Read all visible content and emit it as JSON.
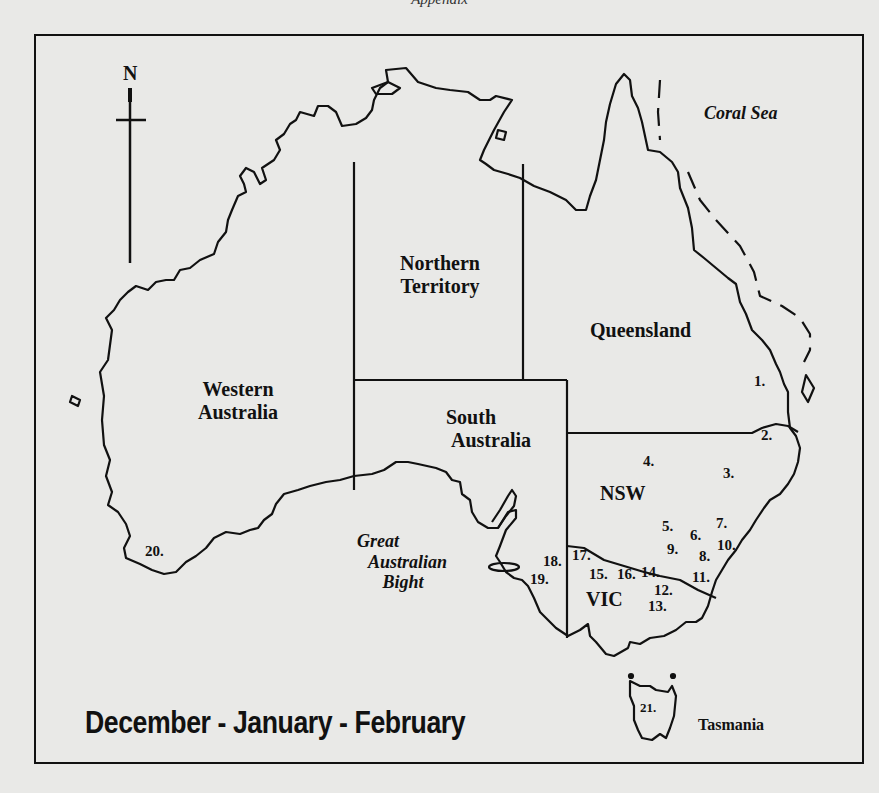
{
  "page_header": "Appendix",
  "map": {
    "title": "December - January - February",
    "compass": {
      "label": "N",
      "icon": "north-arrow-icon"
    },
    "regions": [
      {
        "id": "wa",
        "label_lines": [
          "Western",
          "Australia"
        ]
      },
      {
        "id": "nt",
        "label_lines": [
          "Northern",
          "Territory"
        ]
      },
      {
        "id": "sa",
        "label_lines": [
          "South",
          "Australia"
        ]
      },
      {
        "id": "qld",
        "label_lines": [
          "Queensland"
        ]
      },
      {
        "id": "nsw",
        "label_lines": [
          "NSW"
        ]
      },
      {
        "id": "vic",
        "label_lines": [
          "VIC"
        ]
      },
      {
        "id": "tas",
        "label_lines": [
          "Tasmania"
        ]
      }
    ],
    "water_bodies": [
      {
        "id": "coral_sea",
        "label_lines": [
          "Coral Sea"
        ]
      },
      {
        "id": "gab",
        "label_lines": [
          "Great",
          "Australian",
          "Bight"
        ]
      }
    ],
    "sites": [
      "1.",
      "2.",
      "3.",
      "4.",
      "5.",
      "6.",
      "7.",
      "8.",
      "9.",
      "10.",
      "11.",
      "12.",
      "13.",
      "14.",
      "15.",
      "16.",
      "17.",
      "18.",
      "19.",
      "20.",
      "21."
    ]
  }
}
